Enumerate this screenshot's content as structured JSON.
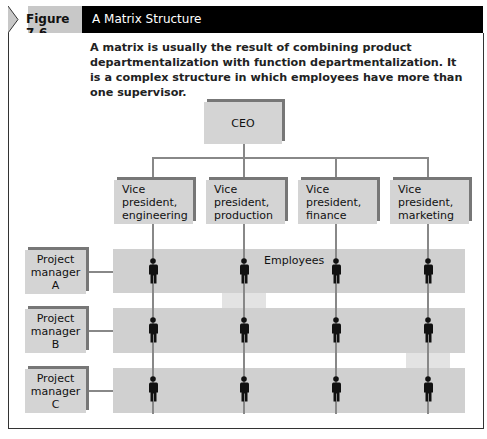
{
  "figure": {
    "label": "Figure 7.6",
    "title": "A Matrix Structure",
    "caption": "A matrix is usually the result of combining product departmentalization with function departmentalization. It is a complex structure in which employees have more than one supervisor."
  },
  "diagram": {
    "top": {
      "label": "CEO"
    },
    "vice_presidents": [
      {
        "label": "Vice\npresident,\nengineering"
      },
      {
        "label": "Vice\npresident,\nproduction"
      },
      {
        "label": "Vice\npresident,\nfinance"
      },
      {
        "label": "Vice\npresident,\nmarketing"
      }
    ],
    "project_managers": [
      {
        "label": "Project\nmanager\nA"
      },
      {
        "label": "Project\nmanager\nB"
      },
      {
        "label": "Project\nmanager\nC"
      }
    ],
    "employees_label": "Employees",
    "employee_icon": "person-icon",
    "colors": {
      "header_label_bg": "#c8c8c8",
      "header_title_bg": "#000000",
      "box_fill": "#d4d4d4",
      "box_shadow": "#777777",
      "band_fill": "#d0d0d0",
      "line": "#888888",
      "person": "#111111"
    }
  }
}
